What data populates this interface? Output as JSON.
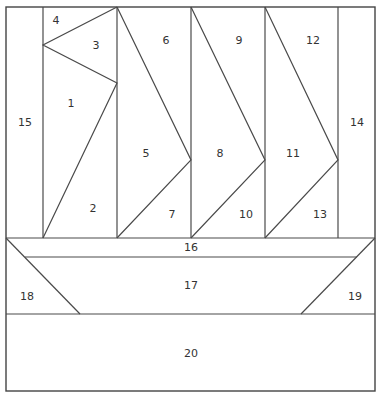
{
  "pieces": [
    {
      "id": "1",
      "label": "1"
    },
    {
      "id": "2",
      "label": "2"
    },
    {
      "id": "3",
      "label": "3"
    },
    {
      "id": "4",
      "label": "4"
    },
    {
      "id": "5",
      "label": "5"
    },
    {
      "id": "6",
      "label": "6"
    },
    {
      "id": "7",
      "label": "7"
    },
    {
      "id": "8",
      "label": "8"
    },
    {
      "id": "9",
      "label": "9"
    },
    {
      "id": "10",
      "label": "10"
    },
    {
      "id": "11",
      "label": "11"
    },
    {
      "id": "12",
      "label": "12"
    },
    {
      "id": "13",
      "label": "13"
    },
    {
      "id": "14",
      "label": "14"
    },
    {
      "id": "15",
      "label": "15"
    },
    {
      "id": "16",
      "label": "16"
    },
    {
      "id": "17",
      "label": "17"
    },
    {
      "id": "18",
      "label": "18"
    },
    {
      "id": "19",
      "label": "19"
    },
    {
      "id": "20",
      "label": "20"
    }
  ],
  "colors": {
    "line": "#4a4a4a",
    "background": "#ffffff",
    "label": "#333333"
  }
}
